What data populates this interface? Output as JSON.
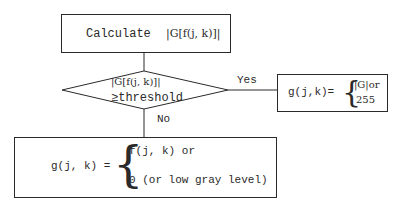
{
  "calc_box": {
    "prefix": "Calculate",
    "expr": "|G[f(j, k)]|"
  },
  "decision": {
    "line1": "|G[f(j, k)]|",
    "line2": "≥threshold"
  },
  "yes_label": "Yes",
  "no_label": "No",
  "yes_box": {
    "lhs": "g(j,k)=",
    "opt1": "|G|or",
    "opt2": "255"
  },
  "no_box": {
    "lhs": "g(j, k) =",
    "opt1": "f(j, k) or",
    "opt2": "0 (or low gray level)"
  }
}
